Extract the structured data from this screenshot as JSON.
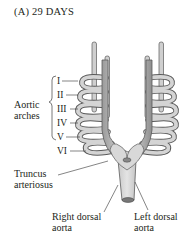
{
  "title": "(A)  29 DAYS",
  "arches": {
    "group_label_line1": "Aortic",
    "group_label_line2": "arches",
    "numerals": [
      "I",
      "II",
      "III",
      "IV",
      "V",
      "VI"
    ]
  },
  "labels": {
    "truncus_line1": "Truncus",
    "truncus_line2": "arteriosus",
    "right_dorsal_line1": "Right dorsal",
    "right_dorsal_line2": "aorta",
    "left_dorsal_line1": "Left dorsal",
    "left_dorsal_line2": "aorta"
  },
  "colors": {
    "vessel_fill": "#c9c9c9",
    "vessel_stroke": "#5a5a5a",
    "text": "#231f20"
  }
}
